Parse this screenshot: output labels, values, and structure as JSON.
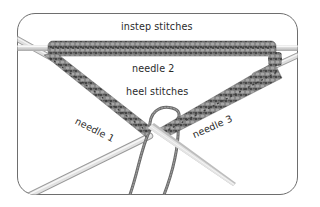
{
  "figure": {
    "type": "knitting-diagram",
    "labels": {
      "instep": "instep stitches",
      "needle2": "needle 2",
      "heel": "heel stitches",
      "needle1": "needle 1",
      "needle3": "needle 3"
    },
    "colors": {
      "frame_border": "#6e6e6e",
      "background": "#ffffff",
      "needle_light": "#e4e4e4",
      "needle_shade": "#b5b5b5",
      "yarn_dark": "#4a4a4a",
      "yarn_mid": "#7a7a7a",
      "yarn_light": "#a3a3a3",
      "text": "#2a2a2a"
    }
  }
}
